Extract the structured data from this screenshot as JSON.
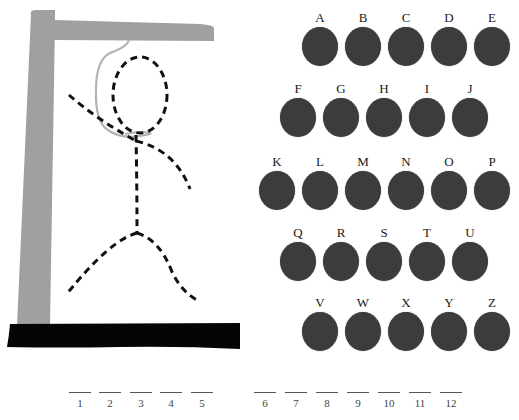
{
  "game": {
    "title": "Hangman",
    "colors": {
      "gallows": "#a0a0a0",
      "base": "#050505",
      "rope": "#b4b4b4",
      "figure": "#111111",
      "letter_disc": "#3c3c3c"
    },
    "figure_parts_drawn": [
      "head",
      "body",
      "left-arm",
      "right-arm",
      "left-leg",
      "right-leg"
    ]
  },
  "keyboard": {
    "rows": [
      {
        "x": 302,
        "y": 11,
        "letters": [
          "A",
          "B",
          "C",
          "D",
          "E"
        ]
      },
      {
        "x": 280,
        "y": 82,
        "letters": [
          "F",
          "G",
          "H",
          "I",
          "J"
        ]
      },
      {
        "x": 259,
        "y": 155,
        "letters": [
          "K",
          "L",
          "M",
          "N",
          "O",
          "P"
        ]
      },
      {
        "x": 280,
        "y": 226,
        "letters": [
          "Q",
          "R",
          "S",
          "T",
          "U"
        ]
      },
      {
        "x": 302,
        "y": 296,
        "letters": [
          "V",
          "W",
          "X",
          "Y",
          "Z"
        ]
      }
    ],
    "spacing": 43
  },
  "word_slots": {
    "word1": [
      "1",
      "2",
      "3",
      "4",
      "5"
    ],
    "word2": [
      "6",
      "7",
      "8",
      "9",
      "10",
      "11",
      "12"
    ]
  }
}
